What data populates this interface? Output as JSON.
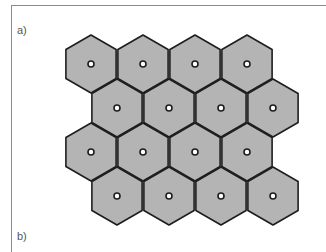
{
  "figure": {
    "panel_labels": {
      "a": "a)",
      "b": "b)"
    },
    "colors": {
      "cell_fill": "#b4b4b4",
      "cell_stroke": "#1e1e1e",
      "site_fill": "#ffffff",
      "frame": "#8a8a8a"
    },
    "hex_grid": {
      "orientation": "pointy-top",
      "radius": 29,
      "site_radius": 3,
      "rows": [
        {
          "y": 64,
          "x": [
            91,
            143,
            195,
            247
          ]
        },
        {
          "y": 108,
          "x": [
            117,
            169,
            221,
            273
          ]
        },
        {
          "y": 152,
          "x": [
            91,
            143,
            195,
            247
          ]
        },
        {
          "y": 196,
          "x": [
            117,
            169,
            221,
            273
          ]
        }
      ]
    }
  }
}
